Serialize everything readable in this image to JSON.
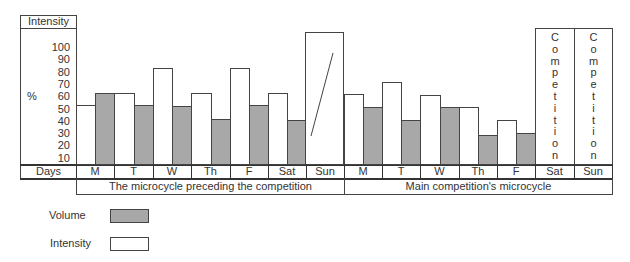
{
  "chart_data": {
    "type": "bar",
    "title": "",
    "ylabel": "%",
    "y_header": "Intensity",
    "xlabel": "Days",
    "y_ticks": [
      100,
      90,
      80,
      70,
      60,
      50,
      40,
      30,
      20,
      10
    ],
    "ylim": [
      0,
      110
    ],
    "grid": false,
    "legend_position": "bottom-left",
    "groups": [
      {
        "label": "The microcycle preceding the competition",
        "days": [
          "M",
          "T",
          "W",
          "Th",
          "F",
          "Sat",
          "Sun"
        ]
      },
      {
        "label": "Main competition's microcycle",
        "days": [
          "M",
          "T",
          "W",
          "Th",
          "F",
          "Sat",
          "Sun"
        ]
      }
    ],
    "categories": [
      "M",
      "T",
      "W",
      "Th",
      "F",
      "Sat",
      "Sun",
      "M",
      "T",
      "W",
      "Th",
      "F",
      "Sat",
      "Sun"
    ],
    "series": [
      {
        "name": "Intensity",
        "color": "#ffffff",
        "values": [
          53,
          63,
          83,
          63,
          83,
          63,
          110,
          62,
          72,
          61,
          51,
          41,
          null,
          null
        ]
      },
      {
        "name": "Volume",
        "color": "#a8a8a8",
        "values": [
          63,
          53,
          52,
          42,
          53,
          41,
          null,
          51,
          41,
          51,
          29,
          30,
          null,
          null
        ]
      }
    ],
    "annotations": [
      {
        "category_index": 6,
        "text": "diagonal stroke inside Sun bar"
      },
      {
        "category_index": 12,
        "text": "Competition"
      },
      {
        "category_index": 13,
        "text": "Competition"
      }
    ]
  },
  "axis": {
    "header": "Intensity",
    "unit": "%",
    "ticks": [
      "100",
      "90",
      "80",
      "70",
      "60",
      "50",
      "40",
      "30",
      "20",
      "10"
    ],
    "days_label": "Days"
  },
  "days": [
    "M",
    "T",
    "W",
    "Th",
    "F",
    "Sat",
    "Sun",
    "M",
    "T",
    "W",
    "Th",
    "F",
    "Sat",
    "Sun"
  ],
  "group_labels": [
    "The microcycle preceding the competition",
    "Main competition's microcycle"
  ],
  "competition_label": [
    "C",
    "o",
    "m",
    "p",
    "e",
    "t",
    "i",
    "t",
    "i",
    "o",
    "n"
  ],
  "legend": {
    "volume": "Volume",
    "intensity": "Intensity",
    "volume_color": "#a8a8a8",
    "intensity_color": "#ffffff"
  }
}
